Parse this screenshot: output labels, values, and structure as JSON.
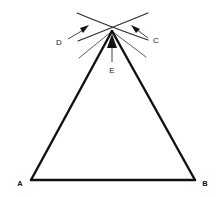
{
  "figure": {
    "background_color": "#ffffff",
    "stroke_color": "#111111",
    "arc_color": "#333333",
    "pointer_color": "#8a8a8a",
    "labels": {
      "a": "A",
      "b": "B",
      "c": "C",
      "d": "D",
      "e": "E"
    },
    "geometry": {
      "vertex_a": [
        31,
        180
      ],
      "vertex_b": [
        195,
        180
      ],
      "apex": [
        112,
        31
      ],
      "baseline_y": 180,
      "triangle_side_width": 2.4,
      "arc_stroke_width": 1.0
    },
    "callouts": {
      "d_label_pos": [
        60,
        42
      ],
      "d_arrow_tip": [
        88,
        26
      ],
      "c_label_pos": [
        152,
        40
      ],
      "c_arrow_tip": [
        132,
        26
      ],
      "e_label_pos": [
        112,
        70
      ],
      "e_arrow_tip": [
        112,
        36
      ]
    }
  }
}
